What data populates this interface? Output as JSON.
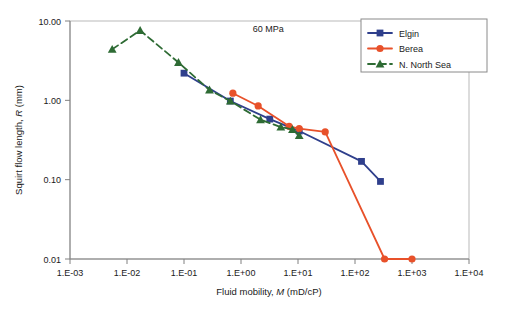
{
  "chart_data": {
    "type": "line",
    "title": "",
    "xlabel": "Fluid mobility, M (mD/cP)",
    "ylabel": "Squirt flow length, R (mm)",
    "xscale": "log",
    "yscale": "log",
    "xlim": [
      0.001,
      10000
    ],
    "ylim": [
      0.01,
      10
    ],
    "grid": false,
    "legend_position": "top-right",
    "xticks": [
      "1.E-03",
      "1.E-02",
      "1.E-01",
      "1.E+00",
      "1.E+01",
      "1.E+02",
      "1.E+03",
      "1.E+04"
    ],
    "xtick_values": [
      0.001,
      0.01,
      0.1,
      1,
      10,
      100,
      1000,
      10000
    ],
    "yticks": [
      "10.00",
      "1.00",
      "0.10",
      "0.01"
    ],
    "ytick_values": [
      10,
      1,
      0.1,
      0.01
    ],
    "annotations": [
      {
        "text": "60 MPa",
        "x": 3.0,
        "y": 7.2
      }
    ],
    "series": [
      {
        "name": "Elgin",
        "color": "#2f3f8c",
        "marker": "square",
        "linestyle": "solid",
        "x": [
          0.1,
          0.65,
          3.2,
          10.5,
          130,
          280
        ],
        "y": [
          2.2,
          0.98,
          0.58,
          0.41,
          0.17,
          0.095
        ]
      },
      {
        "name": "Berea",
        "color": "#e8512a",
        "marker": "circle",
        "linestyle": "solid",
        "x": [
          0.72,
          2.0,
          7.0,
          10.5,
          30,
          330,
          1000
        ],
        "y": [
          1.23,
          0.85,
          0.47,
          0.44,
          0.4,
          0.01,
          0.01
        ]
      },
      {
        "name": "N. North Sea",
        "color": "#2e6b34",
        "marker": "triangle",
        "linestyle": "dashed",
        "x": [
          0.0055,
          0.017,
          0.08,
          0.28,
          0.65,
          2.2,
          5.0,
          8.0,
          10.5
        ],
        "y": [
          4.4,
          7.6,
          3.0,
          1.35,
          0.98,
          0.57,
          0.46,
          0.43,
          0.36
        ]
      }
    ]
  },
  "legend": {
    "items": [
      {
        "label": "Elgin"
      },
      {
        "label": "Berea"
      },
      {
        "label": "N. North Sea"
      }
    ]
  },
  "axes": {
    "x_title_plain_1": "Fluid mobility, ",
    "x_title_italic": "M",
    "x_title_plain_2": " (mD/cP)",
    "y_title_plain_1": "Squirt flow length, ",
    "y_title_italic": "R",
    "y_title_plain_2": " (mm)"
  }
}
